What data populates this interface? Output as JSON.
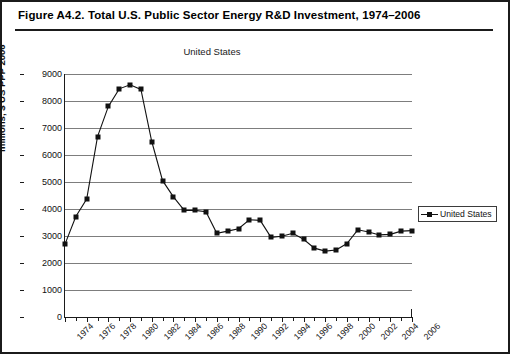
{
  "figure": {
    "caption": "Figure A4.2.  Total U.S. Public Sector Energy R&D Investment, 1974–2006"
  },
  "legend": {
    "position": "right",
    "entries": [
      "United States"
    ]
  },
  "chart_data": {
    "type": "line",
    "title": "United States",
    "xlabel": "",
    "ylabel": "millions, $ US PPP 2006",
    "ylim": [
      0,
      9000
    ],
    "ytick_step": 1000,
    "yticks": [
      0,
      1000,
      2000,
      3000,
      4000,
      5000,
      6000,
      7000,
      8000,
      9000
    ],
    "grid": true,
    "x": [
      1974,
      1975,
      1976,
      1977,
      1978,
      1979,
      1980,
      1981,
      1982,
      1983,
      1984,
      1985,
      1986,
      1987,
      1988,
      1989,
      1990,
      1991,
      1992,
      1993,
      1994,
      1995,
      1996,
      1997,
      1998,
      1999,
      2000,
      2001,
      2002,
      2003,
      2004,
      2005,
      2006
    ],
    "xtick_labels": [
      "1974",
      "1976",
      "1978",
      "1980",
      "1982",
      "1984",
      "1986",
      "1988",
      "1990",
      "1992",
      "1994",
      "1996",
      "1998",
      "2000",
      "2002",
      "2004",
      "2006"
    ],
    "series": [
      {
        "name": "United States",
        "marker": "square",
        "color": "#111111",
        "values": [
          2700,
          3720,
          4370,
          6680,
          7800,
          8450,
          8600,
          8430,
          6500,
          5050,
          4450,
          3950,
          3950,
          3900,
          3100,
          3180,
          3270,
          3600,
          3580,
          2950,
          2990,
          3100,
          2880,
          2550,
          2440,
          2480,
          2720,
          3230,
          3150,
          3040,
          3060,
          3180,
          3200
        ]
      }
    ]
  }
}
